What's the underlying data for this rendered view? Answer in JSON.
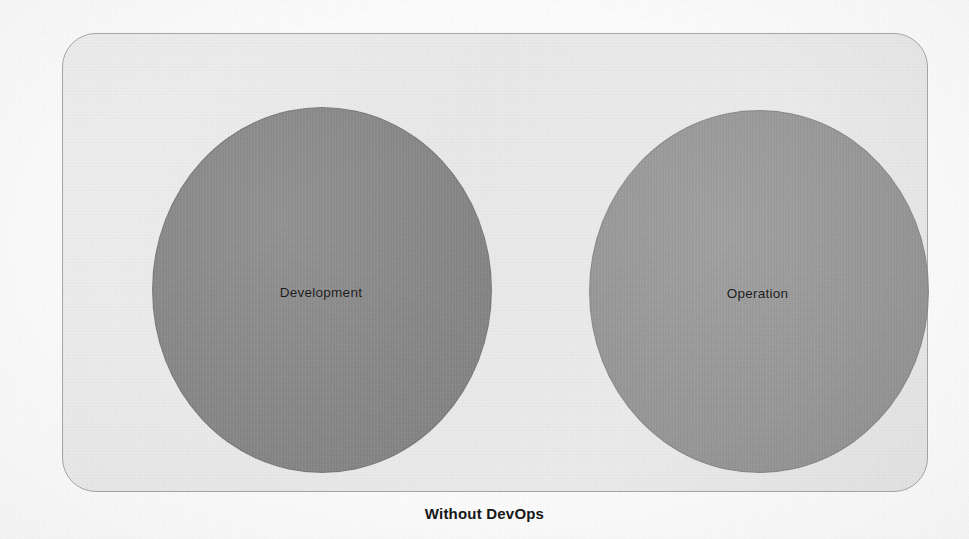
{
  "figure": {
    "caption": "Without DevOps",
    "panel_background_color": "#eeeeee",
    "panel_border_color": "#a9a9a9",
    "page_background_color": "#fdfdfd"
  },
  "sets": [
    {
      "id": "development",
      "label": "Development",
      "fill_color": "#8a8a8a",
      "shape": "circle",
      "position": "left"
    },
    {
      "id": "operation",
      "label": "Operation",
      "fill_color": "#9a9a9a",
      "shape": "circle",
      "position": "right"
    }
  ],
  "bleed_through_text": {
    "line1": "UOIJN",
    "line2": "S",
    "line3": "q",
    "line4": "n",
    "line5": "UL",
    "line6": "uonnjos  s,Ou2O",
    "line7": "no  uouuoo",
    "line8": "ue"
  }
}
